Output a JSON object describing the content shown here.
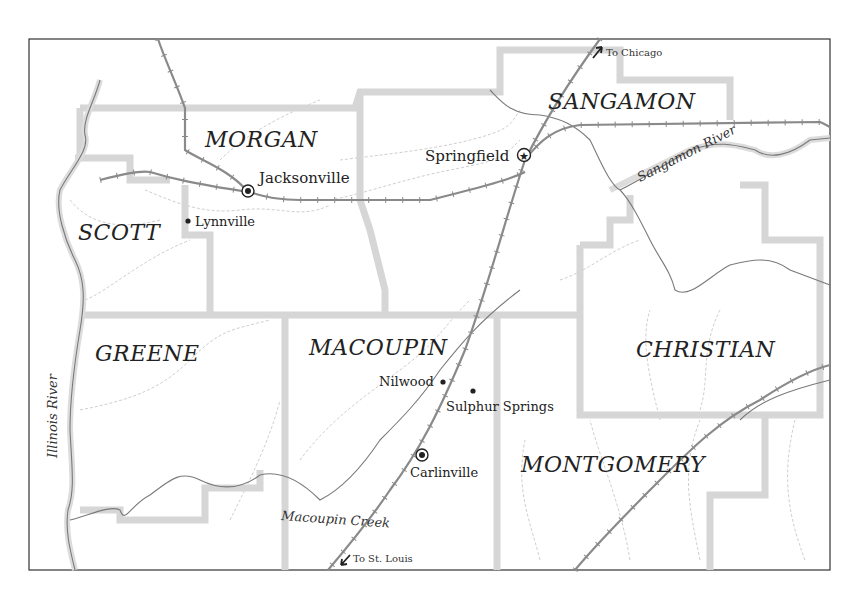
{
  "map": {
    "title": "",
    "counties": [
      {
        "id": "morgan",
        "name": "MORGAN"
      },
      {
        "id": "sangamon",
        "name": "SANGAMON"
      },
      {
        "id": "scott",
        "name": "SCOTT"
      },
      {
        "id": "greene",
        "name": "GREENE"
      },
      {
        "id": "macoupin",
        "name": "MACOUPIN"
      },
      {
        "id": "christian",
        "name": "CHRISTIAN"
      },
      {
        "id": "montgomery",
        "name": "MONTGOMERY"
      }
    ],
    "towns": [
      {
        "id": "jacksonville",
        "name": "Jacksonville",
        "symbol": "county-seat-circle"
      },
      {
        "id": "springfield",
        "name": "Springfield",
        "symbol": "capital-star"
      },
      {
        "id": "lynnville",
        "name": "Lynnville",
        "symbol": "dot"
      },
      {
        "id": "nilwood",
        "name": "Nilwood",
        "symbol": "dot"
      },
      {
        "id": "sulphur_springs",
        "name": "Sulphur Springs",
        "symbol": "dot"
      },
      {
        "id": "carlinville",
        "name": "Carlinville",
        "symbol": "county-seat-circle"
      }
    ],
    "waterways": [
      {
        "id": "illinois_river",
        "name": "Illinois River"
      },
      {
        "id": "sangamon_river",
        "name": "Sangamon River"
      },
      {
        "id": "macoupin_creek",
        "name": "Macoupin Creek"
      }
    ],
    "directions": [
      {
        "id": "to_chicago",
        "label": "To Chicago",
        "arrow": "arrow-northeast"
      },
      {
        "id": "to_st_louis",
        "label": "To St. Louis",
        "arrow": "arrow-southwest"
      }
    ],
    "colors": {
      "frame": "#333333",
      "county_border": "#d6d6d6",
      "railroad": "#8a8a8a",
      "river": "#7a7a7a",
      "text": "#222222"
    }
  }
}
